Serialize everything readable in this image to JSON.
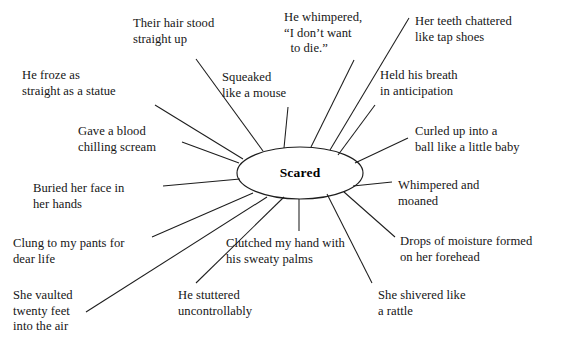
{
  "diagram": {
    "type": "word-web",
    "title_center": "Scared",
    "center_shape": "ellipse",
    "center": {
      "cx": 300,
      "cy": 173,
      "rx": 63,
      "ry": 26
    },
    "line_color": "#1d1d1d",
    "text_color": "#161616",
    "background_color": "#ffffff",
    "spokes": [
      {
        "id": "their-hair-stood-straight-up",
        "text": "Their hair stood\nstraight up",
        "x": 133,
        "y": 16,
        "align": "left",
        "line": {
          "x1": 196,
          "y1": 59,
          "x2": 263,
          "y2": 151
        }
      },
      {
        "id": "he-whimpered-i-dont-want-to-die",
        "text": "He whimpered,\n“I don’t want\n  to die.”",
        "x": 284,
        "y": 10,
        "align": "left",
        "line": {
          "x1": 354,
          "y1": 60,
          "x2": 311,
          "y2": 147
        }
      },
      {
        "id": "her-teeth-chattered-like-tap-shoes",
        "text": "Her teeth chattered\nlike tap shoes",
        "x": 415,
        "y": 14,
        "align": "left",
        "line": {
          "x1": 409,
          "y1": 18,
          "x2": 330,
          "y2": 150
        }
      },
      {
        "id": "squeaked-like-a-mouse",
        "text": "Squeaked\nlike a mouse",
        "x": 222,
        "y": 70,
        "align": "left",
        "line": {
          "x1": 288,
          "y1": 107,
          "x2": 284,
          "y2": 148
        }
      },
      {
        "id": "held-his-breath-in-anticipation",
        "text": "Held his breath\nin anticipation",
        "x": 380,
        "y": 68,
        "align": "left",
        "line": {
          "x1": 375,
          "y1": 105,
          "x2": 338,
          "y2": 155
        }
      },
      {
        "id": "he-froze-as-straight-as-a-statue",
        "text": "He froze as\nstraight as a statue",
        "x": 22,
        "y": 68,
        "align": "left",
        "line": {
          "x1": 155,
          "y1": 105,
          "x2": 243,
          "y2": 159
        }
      },
      {
        "id": "gave-a-blood-chilling-scream",
        "text": "Gave a blood\nchilling scream",
        "x": 78,
        "y": 124,
        "align": "left",
        "line": {
          "x1": 182,
          "y1": 142,
          "x2": 239,
          "y2": 163
        }
      },
      {
        "id": "curled-up-into-a-ball-like-a-little-baby",
        "text": "Curled up into a\nball like a little baby",
        "x": 415,
        "y": 124,
        "align": "left",
        "line": {
          "x1": 408,
          "y1": 138,
          "x2": 355,
          "y2": 163
        }
      },
      {
        "id": "buried-her-face-in-her-hands",
        "text": "Buried her face in\nher hands",
        "x": 33,
        "y": 181,
        "align": "left",
        "line": {
          "x1": 163,
          "y1": 186,
          "x2": 240,
          "y2": 179
        }
      },
      {
        "id": "whimpered-and-moaned",
        "text": "Whimpered and\nmoaned",
        "x": 398,
        "y": 178,
        "align": "left",
        "line": {
          "x1": 392,
          "y1": 182,
          "x2": 353,
          "y2": 186
        }
      },
      {
        "id": "clung-to-my-pants-for-dear-life",
        "text": "Clung to my pants for\ndear life",
        "x": 13,
        "y": 236,
        "align": "left",
        "line": {
          "x1": 152,
          "y1": 237,
          "x2": 253,
          "y2": 193
        }
      },
      {
        "id": "clutched-my-hand-with-his-sweaty-palms",
        "text": "Clutched my hand with\nhis sweaty palms",
        "x": 226,
        "y": 236,
        "align": "left",
        "line": {
          "x1": 299,
          "y1": 231,
          "x2": 299,
          "y2": 199
        }
      },
      {
        "id": "drops-of-moisture-formed-on-her-forehead",
        "text": "Drops of moisture formed\non her forehead",
        "x": 400,
        "y": 234,
        "align": "left",
        "line": {
          "x1": 395,
          "y1": 237,
          "x2": 344,
          "y2": 192
        }
      },
      {
        "id": "she-vaulted-twenty-feet-into-the-air",
        "text": "She vaulted\ntwenty feet\ninto the air",
        "x": 13,
        "y": 288,
        "align": "left",
        "line": {
          "x1": 86,
          "y1": 312,
          "x2": 267,
          "y2": 197
        }
      },
      {
        "id": "he-stuttered-uncontrollably",
        "text": "He stuttered\nuncontrollably",
        "x": 178,
        "y": 288,
        "align": "left",
        "line": {
          "x1": 196,
          "y1": 283,
          "x2": 284,
          "y2": 197
        }
      },
      {
        "id": "she-shivered-like-a-rattle",
        "text": "She shivered like\na rattle",
        "x": 378,
        "y": 288,
        "align": "left",
        "line": {
          "x1": 372,
          "y1": 283,
          "x2": 327,
          "y2": 194
        }
      }
    ]
  }
}
